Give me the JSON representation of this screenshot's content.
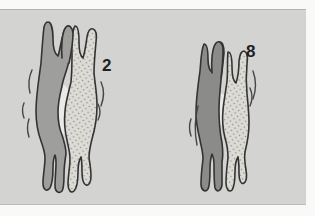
{
  "figure": {
    "page_bg": "#f9f9f7",
    "panel_bg": "#d3d3d1",
    "panel_edge_top": "#b2b2b0",
    "panel_edge_bottom": "#bcbcba",
    "outline": "#333333",
    "vibration_color": "#464646",
    "gap_highlight": "#eaeae6",
    "label_color": "#1f1f1f",
    "pairs": [
      {
        "label": "2",
        "solid_fill": "#9e9e9c",
        "stippled_fill": "#dddbd6",
        "dot_color": "#8e8e8a"
      },
      {
        "label": "8",
        "solid_fill": "#8b8b89",
        "stippled_fill": "#dddbd6",
        "dot_color": "#8e8e8a"
      }
    ]
  }
}
